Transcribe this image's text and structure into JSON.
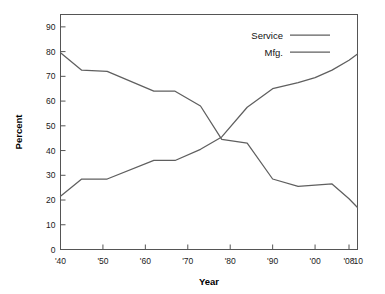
{
  "chart_data": {
    "type": "line",
    "title": "",
    "subtitle": "",
    "xlabel": "Year",
    "ylabel": "Percent",
    "grid": false,
    "legend_position": "top-right",
    "xlim": [
      1940,
      2010
    ],
    "ylim": [
      0,
      95
    ],
    "yticks": [
      0,
      10,
      20,
      30,
      40,
      50,
      60,
      70,
      80,
      90
    ],
    "ytick_labels": [
      "0",
      "10",
      "20",
      "30",
      "40",
      "50",
      "60",
      "70",
      "80",
      "90"
    ],
    "xticks": [
      1940,
      1950,
      1960,
      1970,
      1980,
      1990,
      2000,
      2008,
      2010
    ],
    "xtick_labels": [
      "'40",
      "'50",
      "'60",
      "'70",
      "'80",
      "'90",
      "'00",
      "'08",
      "'10"
    ],
    "series": [
      {
        "name": "Service",
        "color": "#5f5f5f",
        "x": [
          1940,
          1945,
          1951,
          1962,
          1967,
          1973,
          1978,
          1984,
          1990,
          1996,
          2000,
          2004,
          2008,
          2010
        ],
        "values": [
          21.5,
          28.5,
          28.5,
          36.0,
          36.0,
          40.5,
          45.5,
          57.5,
          65.0,
          67.5,
          69.5,
          72.5,
          76.5,
          79.0
        ]
      },
      {
        "name": "Mfg.",
        "color": "#5f5f5f",
        "x": [
          1940,
          1945,
          1951,
          1962,
          1967,
          1973,
          1978,
          1984,
          1990,
          1996,
          2000,
          2004,
          2008,
          2010
        ],
        "values": [
          79.5,
          72.5,
          72.0,
          64.0,
          64.0,
          58.0,
          44.5,
          43.0,
          28.5,
          25.5,
          26.0,
          26.5,
          20.5,
          17.0
        ]
      }
    ],
    "annotations": []
  },
  "legend": {
    "items": [
      {
        "label": "Service"
      },
      {
        "label": "Mfg."
      }
    ]
  },
  "axes": {
    "y_title": "Percent",
    "x_title": "Year"
  }
}
